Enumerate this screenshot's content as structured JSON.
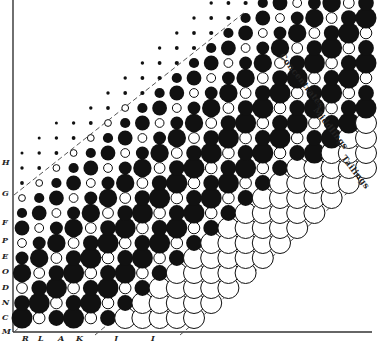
{
  "figure": {
    "type": "ore classification lattice diagram",
    "zones": [
      {
        "label": "Concentrates",
        "x": 279,
        "y": 56,
        "rotate": 52
      },
      {
        "label": "Middlings",
        "x": 313,
        "y": 110,
        "rotate": 52
      },
      {
        "label": "Tailings",
        "x": 341,
        "y": 158,
        "rotate": 52
      }
    ],
    "y_axis_labels": [
      {
        "label": "H",
        "y": 162
      },
      {
        "label": "G",
        "y": 193
      },
      {
        "label": "F",
        "y": 222
      },
      {
        "label": "P",
        "y": 240
      },
      {
        "label": "E",
        "y": 256
      },
      {
        "label": "O",
        "y": 271
      },
      {
        "label": "D",
        "y": 287
      },
      {
        "label": "N",
        "y": 302
      },
      {
        "label": "C",
        "y": 317
      },
      {
        "label": "M",
        "y": 331
      }
    ],
    "x_axis_labels": [
      {
        "label": "R",
        "x": 25
      },
      {
        "label": "L",
        "x": 41
      },
      {
        "label": "A",
        "x": 61
      },
      {
        "label": "K",
        "x": 79
      },
      {
        "label": "J",
        "x": 117
      },
      {
        "label": "I",
        "x": 154
      }
    ],
    "dashed_boundaries": [
      {
        "name": "upper-limit",
        "x1": 14,
        "y1": 195,
        "x2": 245,
        "y2": 12
      },
      {
        "name": "concentrates-middlings",
        "x1": 14,
        "y1": 332,
        "x2": 305,
        "y2": 84
      },
      {
        "name": "middlings-tailings",
        "x1": 95,
        "y1": 335,
        "x2": 340,
        "y2": 132
      },
      {
        "name": "tailings-limit",
        "x1": 180,
        "y1": 335,
        "x2": 372,
        "y2": 172
      }
    ],
    "axes": {
      "origin_x": 13,
      "origin_y": 331,
      "top_y": 0,
      "right_x": 372
    },
    "colors": {
      "ink": "#111111",
      "dash": "#555555",
      "background": "#ffffff"
    },
    "lattice": {
      "u": [
        17.2,
        -15.0
      ],
      "v": [
        17.2,
        0
      ],
      "origin": [
        22,
        318
      ],
      "rows": 18,
      "cols": 18
    }
  }
}
